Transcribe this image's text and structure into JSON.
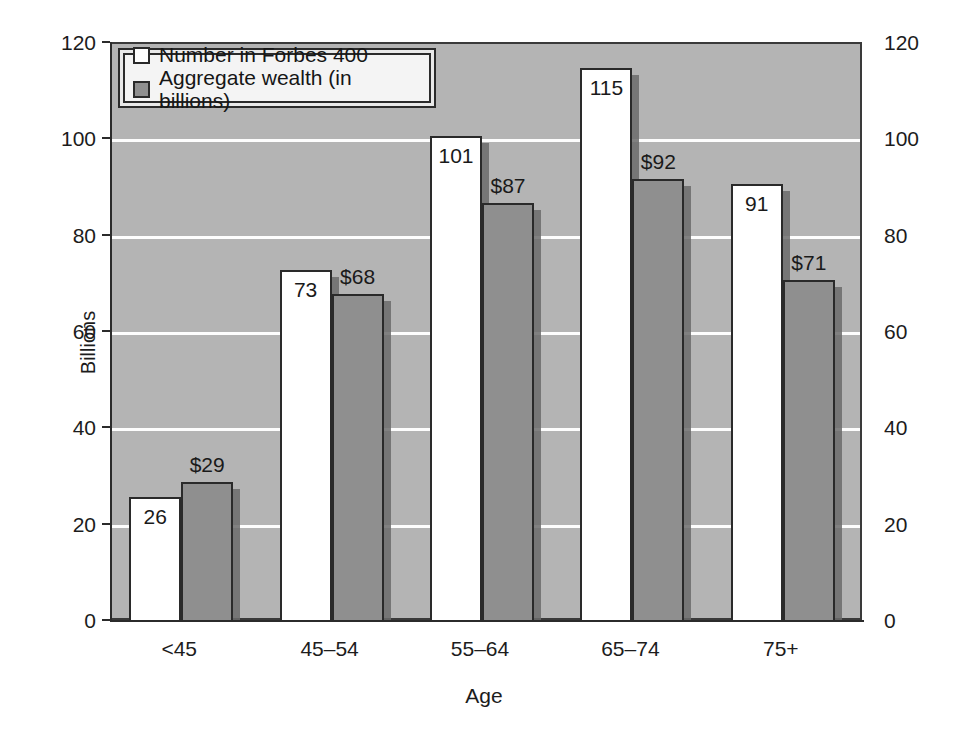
{
  "chart_data": {
    "type": "bar",
    "title": "",
    "subtitle": "",
    "xlabel": "Age",
    "ylabel": "Billions",
    "y2label": "Number in Forbes 400",
    "categories": [
      "<45",
      "45–54",
      "55–64",
      "65–74",
      "75+"
    ],
    "series": [
      {
        "name": "Number in Forbes 400",
        "axis": "right",
        "color": "#ffffff",
        "values": [
          26,
          73,
          101,
          115,
          91
        ],
        "labels": [
          "26",
          "73",
          "101",
          "115",
          "91"
        ],
        "label_position": [
          "inside",
          "inside",
          "inside",
          "inside",
          "inside"
        ]
      },
      {
        "name": "Aggregate wealth (in billions)",
        "axis": "left",
        "color": "#8f8f8f",
        "values": [
          29,
          68,
          87,
          92,
          71
        ],
        "labels": [
          "$29",
          "$68",
          "$87",
          "$92",
          "$71"
        ],
        "label_position": [
          "above",
          "above",
          "above",
          "above",
          "above"
        ]
      }
    ],
    "ylim": [
      0,
      120
    ],
    "y2lim": [
      0,
      120
    ],
    "yticks": [
      0,
      20,
      40,
      60,
      80,
      100,
      120
    ],
    "y2ticks": [
      0,
      20,
      40,
      60,
      80,
      100,
      120
    ],
    "ytick_labels": [
      "0",
      "20",
      "40",
      "60",
      "80",
      "100",
      "120"
    ],
    "y2tick_labels": [
      "0",
      "20",
      "40",
      "60",
      "80",
      "100",
      "120"
    ],
    "grid": true,
    "grid_color": "#ffffff",
    "plot_background": "#b4b4b4",
    "legend_position": "top-left"
  },
  "legend": {
    "items": [
      {
        "label": "Number in Forbes 400",
        "swatch": "white"
      },
      {
        "label": "Aggregate wealth (in billions)",
        "swatch": "gray"
      }
    ]
  },
  "axes": {
    "left_title": "Billions",
    "right_title": "Number in Forbes 400",
    "bottom_title": "Age"
  },
  "colors": {
    "series_white": "#ffffff",
    "series_gray": "#8f8f8f",
    "plot_bg": "#b4b4b4",
    "gridline": "#ffffff",
    "axis": "#2b2b2b",
    "text": "#1c1c1c"
  }
}
